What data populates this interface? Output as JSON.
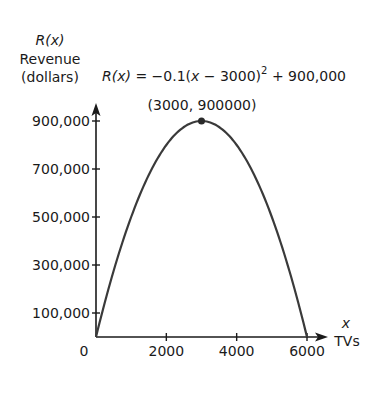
{
  "chart_data": {
    "type": "line",
    "title": "",
    "equation": {
      "lhs": "R(x)",
      "rhs_prefix": " = −0.1(",
      "var": "x",
      "rhs_mid": " − 3000)",
      "exp": "2",
      "rhs_suffix": " + 900,000"
    },
    "ylabel_var": "R(x)",
    "ylabel_line1": "Revenue",
    "ylabel_line2": "(dollars)",
    "xlabel_var": "x",
    "xlabel": "TVs",
    "xlim": [
      0,
      6000
    ],
    "ylim": [
      0,
      900000
    ],
    "x_ticks": [
      {
        "value": 0,
        "label": "0"
      },
      {
        "value": 2000,
        "label": "2000"
      },
      {
        "value": 4000,
        "label": "4000"
      },
      {
        "value": 6000,
        "label": "6000"
      }
    ],
    "y_ticks": [
      {
        "value": 100000,
        "label": "100,000"
      },
      {
        "value": 300000,
        "label": "300,000"
      },
      {
        "value": 500000,
        "label": "500,000"
      },
      {
        "value": 700000,
        "label": "700,000"
      },
      {
        "value": 900000,
        "label": "900,000"
      }
    ],
    "grid": false,
    "series": [
      {
        "name": "R(x) = -0.1(x - 3000)^2 + 900,000",
        "x": [
          0,
          500,
          1000,
          1500,
          2000,
          2500,
          3000,
          3500,
          4000,
          4500,
          5000,
          5500,
          6000
        ],
        "values": [
          0,
          275000,
          500000,
          675000,
          800000,
          875000,
          900000,
          875000,
          800000,
          675000,
          500000,
          275000,
          0
        ]
      }
    ],
    "annotations": [
      {
        "x": 3000,
        "y": 900000,
        "label": "(3000, 900000)",
        "marker": "point"
      }
    ],
    "colors": {
      "curve": "#3a3a3a",
      "axis": "#1a1a1a",
      "point": "#2a2a2a"
    }
  }
}
